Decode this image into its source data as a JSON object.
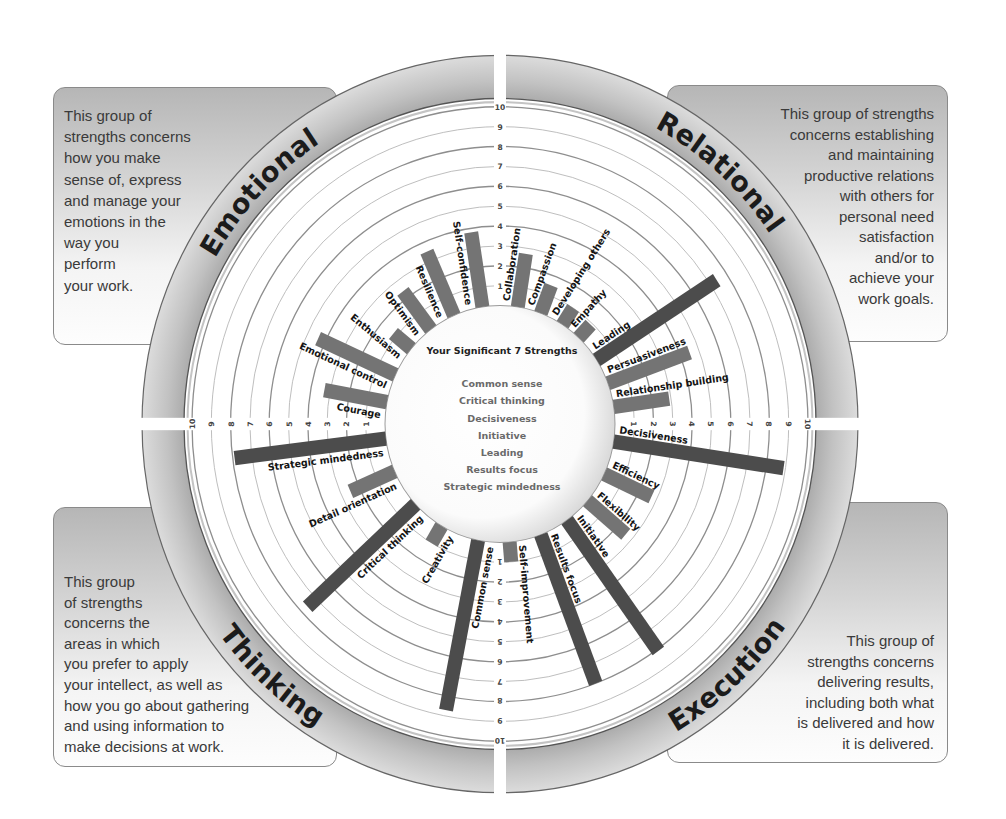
{
  "chart_data": {
    "type": "bar",
    "layout": "radial",
    "title": "Your Significant 7 Strengths",
    "xlabel": "",
    "ylabel": "",
    "scale": {
      "min": 0,
      "max": 10,
      "ticks": [
        1,
        2,
        3,
        4,
        5,
        6,
        7,
        8,
        9,
        10
      ]
    },
    "grid": true,
    "categories": [
      "Collaboration",
      "Compassion",
      "Developing others",
      "Empathy",
      "Leading",
      "Persuasiveness",
      "Relationship building",
      "Decisiveness",
      "Efficiency",
      "Flexibility",
      "Initiative",
      "Results focus",
      "Self-improvement",
      "Common sense",
      "Creativity",
      "Critical thinking",
      "Detail orientation",
      "Strategic mindedness",
      "Courage",
      "Emotional control",
      "Enthusiasm",
      "Optimism",
      "Resilience",
      "Self-confidence"
    ],
    "values": [
      2.7,
      1.5,
      1.0,
      0.9,
      7.4,
      4.5,
      2.9,
      8.9,
      2.7,
      2.6,
      8.1,
      8.0,
      1.0,
      8.7,
      1.0,
      7.6,
      2.5,
      7.9,
      3.3,
      4.4,
      1.2,
      2.4,
      3.5,
      3.8
    ],
    "groups": [
      {
        "id": "relational",
        "name": "Relational",
        "description": [
          "This group of strengths",
          "concerns establishing",
          "and maintaining",
          "productive relations",
          "with others for",
          "personal need",
          "satisfaction",
          "and/or to",
          "achieve your",
          "work goals."
        ],
        "bars": [
          {
            "label": "Collaboration",
            "value": 2.7,
            "angle_deg": 8.9,
            "significant": false
          },
          {
            "label": "Compassion",
            "value": 1.5,
            "angle_deg": 20.8,
            "significant": false
          },
          {
            "label": "Developing others",
            "value": 1.0,
            "angle_deg": 33.0,
            "significant": false
          },
          {
            "label": "Empathy",
            "value": 0.9,
            "angle_deg": 43.2,
            "significant": false
          },
          {
            "label": "Leading",
            "value": 7.4,
            "angle_deg": 57.2,
            "significant": true
          },
          {
            "label": "Persuasiveness",
            "value": 4.5,
            "angle_deg": 69.9,
            "significant": false
          },
          {
            "label": "Relationship building",
            "value": 2.9,
            "angle_deg": 81.7,
            "significant": false
          }
        ]
      },
      {
        "id": "execution",
        "name": "Execution",
        "description": [
          "This group of",
          "strengths concerns",
          "delivering results,",
          "including both what",
          "is delivered and how",
          "it is delivered."
        ],
        "bars": [
          {
            "label": "Decisiveness",
            "value": 8.9,
            "angle_deg": 98.6,
            "significant": true
          },
          {
            "label": "Efficiency",
            "value": 2.7,
            "angle_deg": 115.0,
            "significant": false
          },
          {
            "label": "Flexibility",
            "value": 2.6,
            "angle_deg": 130.4,
            "significant": false
          },
          {
            "label": "Initiative",
            "value": 8.1,
            "angle_deg": 144.3,
            "significant": true
          },
          {
            "label": "Results focus",
            "value": 8.0,
            "angle_deg": 159.2,
            "significant": true
          },
          {
            "label": "Self-improvement",
            "value": 1.0,
            "angle_deg": 175.2,
            "significant": false
          }
        ]
      },
      {
        "id": "thinking",
        "name": "Thinking",
        "description": [
          "This group",
          "of strengths",
          "concerns the",
          "areas in which",
          "you prefer to apply",
          "your intellect, as well as",
          "how you go about gathering",
          "and using information to",
          "make decisions at work."
        ],
        "bars": [
          {
            "label": "Common sense",
            "value": 8.7,
            "angle_deg": 191.0,
            "significant": true
          },
          {
            "label": "Creativity",
            "value": 1.0,
            "angle_deg": 210.6,
            "significant": false
          },
          {
            "label": "Critical thinking",
            "value": 7.6,
            "angle_deg": 227.3,
            "significant": true
          },
          {
            "label": "Detail orientation",
            "value": 2.5,
            "angle_deg": 246.4,
            "significant": false
          },
          {
            "label": "Strategic mindedness",
            "value": 7.9,
            "angle_deg": 262.9,
            "significant": true
          }
        ]
      },
      {
        "id": "emotional",
        "name": "Emotional",
        "description": [
          "This group of",
          "strengths concerns",
          "how you make",
          "sense of, express",
          "and manage your",
          "emotions in the",
          "way you",
          "perform",
          "your work."
        ],
        "bars": [
          {
            "label": "Courage",
            "value": 3.3,
            "angle_deg": 280.6,
            "significant": false
          },
          {
            "label": "Emotional control",
            "value": 4.4,
            "angle_deg": 294.5,
            "significant": false
          },
          {
            "label": "Enthusiasm",
            "value": 1.2,
            "angle_deg": 309.5,
            "significant": false
          },
          {
            "label": "Optimism",
            "value": 2.4,
            "angle_deg": 323.0,
            "significant": false
          },
          {
            "label": "Resilience",
            "value": 3.5,
            "angle_deg": 336.4,
            "significant": false
          },
          {
            "label": "Self-confidence",
            "value": 3.8,
            "angle_deg": 351.2,
            "significant": false
          }
        ]
      }
    ],
    "significant_strengths": {
      "title": "Your Significant 7 Strengths",
      "items": [
        "Common sense",
        "Critical thinking",
        "Decisiveness",
        "Initiative",
        "Leading",
        "Results focus",
        "Strategic mindedness"
      ]
    },
    "colors": {
      "bar": "#747474",
      "significant_bar": "#4c4c4c",
      "ring_band": "#bdbdbd",
      "label_text": "#141414",
      "box_fill": "#b6b6b6"
    }
  }
}
